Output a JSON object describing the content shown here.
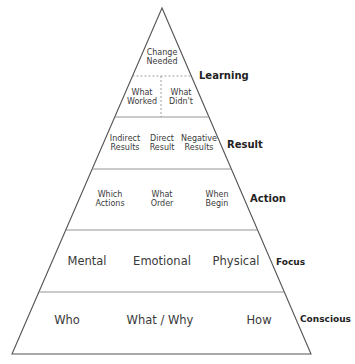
{
  "diagram": {
    "type": "pyramid",
    "colors": {
      "outline": "#555555",
      "divider": "#888888",
      "text": "#3a3a3a",
      "label": "#222222"
    },
    "levels": [
      {
        "label": "Learning",
        "rows": [
          {
            "cells": [
              {
                "lines": [
                  "Change",
                  "Needed"
                ]
              }
            ]
          },
          {
            "cells": [
              {
                "lines": [
                  "What",
                  "Worked"
                ]
              },
              {
                "lines": [
                  "What",
                  "Didn't"
                ]
              }
            ]
          }
        ]
      },
      {
        "label": "Result",
        "cells": [
          {
            "lines": [
              "Indirect",
              "Results"
            ]
          },
          {
            "lines": [
              "Direct",
              "Result"
            ]
          },
          {
            "lines": [
              "Negative",
              "Results"
            ]
          }
        ]
      },
      {
        "label": "Action",
        "cells": [
          {
            "lines": [
              "Which",
              "Actions"
            ]
          },
          {
            "lines": [
              "What",
              "Order"
            ]
          },
          {
            "lines": [
              "When",
              "Begin"
            ]
          }
        ]
      },
      {
        "label": "Focus",
        "cells": [
          {
            "lines": [
              "Mental"
            ]
          },
          {
            "lines": [
              "Emotional"
            ]
          },
          {
            "lines": [
              "Physical"
            ]
          }
        ]
      },
      {
        "label": "Conscious",
        "cells": [
          {
            "lines": [
              "Who"
            ]
          },
          {
            "lines": [
              "What / Why"
            ]
          },
          {
            "lines": [
              "How"
            ]
          }
        ]
      }
    ]
  }
}
